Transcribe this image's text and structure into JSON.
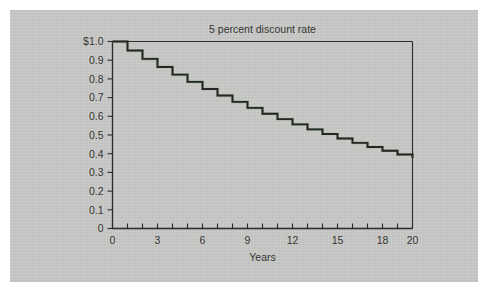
{
  "figure": {
    "background_color": "#ffffff",
    "panel_color": "#c9cac7",
    "axis_color": "#2b2b2b",
    "line_color": "#262626",
    "accent_color": "#4f7d52"
  },
  "chart_data": {
    "type": "line",
    "subtype": "step",
    "title": "5 percent discount rate",
    "xlabel": "Years",
    "ylabel": "",
    "xlim": [
      0,
      20
    ],
    "ylim": [
      0,
      1.0
    ],
    "grid": false,
    "legend": "none",
    "x_tick_labels": [
      "0",
      "3",
      "6",
      "9",
      "12",
      "15",
      "18",
      "20"
    ],
    "x_tick_values": [
      0,
      3,
      6,
      9,
      12,
      15,
      18,
      20
    ],
    "x_minor_tick_values": [
      0,
      1,
      2,
      3,
      4,
      5,
      6,
      7,
      8,
      9,
      10,
      11,
      12,
      13,
      14,
      15,
      16,
      17,
      18,
      19,
      20
    ],
    "y_tick_labels": [
      "$1.0",
      "0.9",
      "0.8",
      "0.7",
      "0.6",
      "0.5",
      "0.4",
      "0.3",
      "0.2",
      "0.1",
      "0"
    ],
    "y_tick_values": [
      1.0,
      0.9,
      0.8,
      0.7,
      0.6,
      0.5,
      0.4,
      0.3,
      0.2,
      0.1,
      0
    ],
    "series": [
      {
        "name": "discount factor",
        "x": [
          0,
          1,
          2,
          3,
          4,
          5,
          6,
          7,
          8,
          9,
          10,
          11,
          12,
          13,
          14,
          15,
          16,
          17,
          18,
          19,
          20
        ],
        "values": [
          1.0,
          0.952,
          0.907,
          0.864,
          0.823,
          0.784,
          0.746,
          0.711,
          0.677,
          0.645,
          0.614,
          0.585,
          0.557,
          0.53,
          0.505,
          0.481,
          0.458,
          0.436,
          0.416,
          0.396,
          0.377
        ]
      }
    ]
  }
}
